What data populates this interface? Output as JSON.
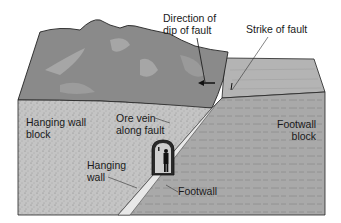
{
  "diagram": {
    "labels": {
      "dip_direction": "Direction of\ndip of fault",
      "strike": "Strike of fault",
      "hanging_wall_block": "Hanging wall\nblock",
      "ore_vein": "Ore vein\nalong fault",
      "footwall_block": "Footwall\nblock",
      "hanging_wall": "Hanging\nwall",
      "footwall": "Footwall"
    },
    "colors": {
      "mountain_top": "#8a8a8a",
      "mountain_highlight": "#a6a6a6",
      "footwall_top": "#b4b4b4",
      "hanging_wall_face": "#c4c4c4",
      "footwall_face": "#a9a9a9",
      "ore_vein": "#e8e8e8",
      "tunnel": "#2a2a2a",
      "outline": "#222222"
    }
  }
}
